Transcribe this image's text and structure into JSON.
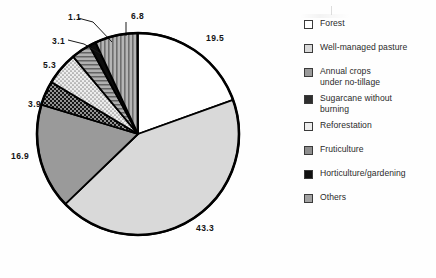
{
  "chart_data": {
    "type": "pie",
    "title": "",
    "subtitle": "",
    "xlabel": "",
    "ylabel": "",
    "units": "percent",
    "legend_position": "right",
    "grid": false,
    "start_angle_deg": 0,
    "direction": "clockwise",
    "total": 100.0,
    "categories": [
      "Forest",
      "Well-managed pasture",
      "Annual crops\nunder no-tillage",
      "Sugarcane without\nburning",
      "Reforestation",
      "Fruticulture",
      "Horticulture/gardening",
      "Others"
    ],
    "values": [
      19.5,
      43.3,
      16.9,
      3.9,
      5.3,
      3.1,
      1.1,
      6.8
    ],
    "slices": [
      {
        "label": "Forest",
        "value": 19.5,
        "data_label": "19.5",
        "fill": "#ffffff",
        "pattern": "solid",
        "label_x": 206,
        "label_y": 34
      },
      {
        "label": "Well-managed pasture",
        "value": 43.3,
        "data_label": "43.3",
        "fill": "#d9d9d9",
        "pattern": "solid",
        "label_x": 196,
        "label_y": 224
      },
      {
        "label": "Annual crops under no-tillage",
        "value": 16.9,
        "data_label": "16.9",
        "fill": "#9a9a9a",
        "pattern": "solid",
        "label_x": 11,
        "label_y": 152
      },
      {
        "label": "Sugarcane without burning",
        "value": 3.9,
        "data_label": "3.9",
        "fill": "#1b1b1b",
        "pattern": "dots-light",
        "label_x": 28,
        "label_y": 100
      },
      {
        "label": "Reforestation",
        "value": 5.3,
        "data_label": "5.3",
        "fill": "#ececec",
        "pattern": "dots-dark",
        "label_x": 43,
        "label_y": 61
      },
      {
        "label": "Fruticulture",
        "value": 3.1,
        "data_label": "3.1",
        "fill": "#8e8e8e",
        "pattern": "hlines",
        "label_x": 52,
        "label_y": 37
      },
      {
        "label": "Horticulture/gardening",
        "value": 1.1,
        "data_label": "1.1",
        "fill": "#0d0d0d",
        "pattern": "solid",
        "label_x": 68,
        "label_y": 13
      },
      {
        "label": "Others",
        "value": 6.8,
        "data_label": "6.8",
        "fill": "#a2a2a2",
        "pattern": "vlines",
        "label_x": 131,
        "label_y": 12
      }
    ],
    "geometry": {
      "cx": 138,
      "cy": 134,
      "r": 101
    }
  },
  "legend": {
    "items": [
      {
        "label": "Forest",
        "swatch_class": "sw-forest",
        "swatch_name": "legend-swatch-forest"
      },
      {
        "label": "Well-managed pasture",
        "swatch_class": "sw-pasture",
        "swatch_name": "legend-swatch-well-managed-pasture"
      },
      {
        "label": "Annual crops\nunder no-tillage",
        "swatch_class": "sw-annual",
        "swatch_name": "legend-swatch-annual-crops"
      },
      {
        "label": "Sugarcane without\nburning",
        "swatch_class": "sw-sugar",
        "swatch_name": "legend-swatch-sugarcane"
      },
      {
        "label": "Reforestation",
        "swatch_class": "sw-refor",
        "swatch_name": "legend-swatch-reforestation"
      },
      {
        "label": "Fruticulture",
        "swatch_class": "sw-fruit",
        "swatch_name": "legend-swatch-fruticulture"
      },
      {
        "label": "Horticulture/gardening",
        "swatch_class": "sw-horti",
        "swatch_name": "legend-swatch-horticulture"
      },
      {
        "label": "Others",
        "swatch_class": "sw-others",
        "swatch_name": "legend-swatch-others"
      }
    ]
  },
  "colors": {
    "outline": "#000000",
    "text": "#2b2b2b",
    "label_text": "#141414",
    "background": "#fefefe"
  }
}
